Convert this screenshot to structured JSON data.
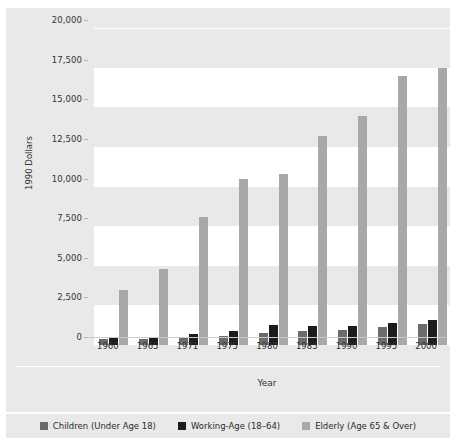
{
  "figure": {
    "title": "",
    "background_color": "#e9e9e9",
    "plot_background_color": "#ffffff"
  },
  "axis": {
    "y_title": "1990 Dollars",
    "x_title": "Year"
  },
  "legend": {
    "position": "bottom",
    "items": [
      {
        "label": "Children (Under Age 18)",
        "color": "#6b6b6b",
        "key": "children"
      },
      {
        "label": "Working-Age (18–64)",
        "color": "#1c1c1c",
        "key": "working"
      },
      {
        "label": "Elderly (Age 65 & Over)",
        "color": "#a8a8a8",
        "key": "elderly"
      }
    ]
  },
  "chart_data": {
    "type": "bar",
    "title": "",
    "xlabel": "Year",
    "ylabel": "1990 Dollars",
    "categories": [
      "1960",
      "1965",
      "1971",
      "1975",
      "1980",
      "1985",
      "1990",
      "1995",
      "2000"
    ],
    "ylim": [
      0,
      20000
    ],
    "yticks": [
      0,
      2500,
      5000,
      7500,
      10000,
      12500,
      15000,
      17500,
      20000
    ],
    "ytick_labels": [
      "0",
      "2,500",
      "5,000",
      "7,500",
      "10,000",
      "12,500",
      "15,000",
      "17,500",
      "20,000"
    ],
    "grid": true,
    "legend_position": "bottom",
    "series": [
      {
        "name": "Children (Under Age 18)",
        "color": "#6b6b6b",
        "values": [
          350,
          400,
          500,
          560,
          750,
          860,
          950,
          1150,
          1320
        ]
      },
      {
        "name": "Working-Age (18–64)",
        "color": "#1c1c1c",
        "values": [
          480,
          500,
          700,
          900,
          1280,
          1200,
          1230,
          1400,
          1580
        ]
      },
      {
        "name": "Elderly (Age 65 & Over)",
        "color": "#a8a8a8",
        "values": [
          3500,
          4800,
          8100,
          10500,
          10800,
          13200,
          14450,
          17000,
          17500
        ]
      }
    ]
  }
}
